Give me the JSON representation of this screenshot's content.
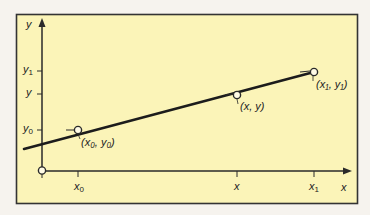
{
  "diagram": {
    "type": "linear-interpolation",
    "colors": {
      "page_background": "#f6f3ee",
      "panel_fill": "#fbf4b8",
      "frame": "#333333",
      "axis": "#2a2a2a",
      "line": "#1c1c1c",
      "point_fill": "#fffbe6"
    },
    "axes": {
      "y_label": "y",
      "x_label": "x"
    },
    "y_ticks": [
      {
        "base": "y",
        "sub": "1"
      },
      {
        "base": "y",
        "sub": ""
      },
      {
        "base": "y",
        "sub": "0"
      }
    ],
    "x_ticks": [
      {
        "base": "x",
        "sub": "0"
      },
      {
        "base": "x",
        "sub": ""
      },
      {
        "base": "x",
        "sub": "1"
      }
    ],
    "points": [
      {
        "label": "(x₀, y₀)"
      },
      {
        "label": "(x, y)"
      },
      {
        "label": "(x₁, y₁)"
      }
    ]
  }
}
